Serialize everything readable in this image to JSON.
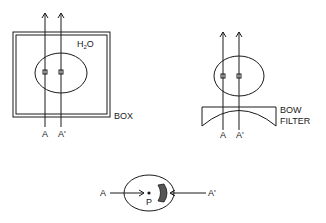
{
  "diagram": {
    "panels": [
      {
        "id": "box-setup",
        "labels": {
          "beam_a": "A",
          "beam_a_prime": "A'",
          "medium_main": "H",
          "medium_sub": "2",
          "medium_tail": "O",
          "container": "BOX"
        }
      },
      {
        "id": "bow-filter-setup",
        "labels": {
          "beam_a": "A",
          "beam_a_prime": "A'",
          "filter_line1": "BOW",
          "filter_line2": "FILTER"
        }
      },
      {
        "id": "top-view",
        "labels": {
          "beam_a": "A",
          "beam_a_prime": "A'",
          "point": "P"
        }
      }
    ],
    "colors": {
      "stroke": "#1a1a1a",
      "crescent_fill": "#555555",
      "background": "#ffffff"
    }
  }
}
